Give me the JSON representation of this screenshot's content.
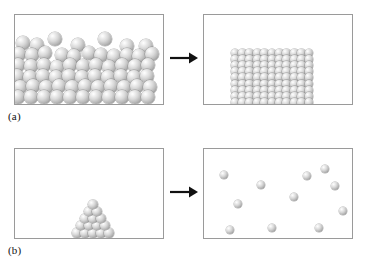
{
  "figure": {
    "panel_border_color": "#9a9a9a",
    "background_color": "#ffffff",
    "sphere_color": "#b4b4b4",
    "arrow_color": "#111111"
  },
  "rows": [
    {
      "id": "a",
      "caption": "(a)",
      "arrow": "right-arrow",
      "left_panel": {
        "name": "disordered-dense-particles",
        "particle_count": 72,
        "description": "many spheres packed irregularly filling lower two-thirds of box"
      },
      "right_panel": {
        "name": "ordered-crystal-lattice",
        "particle_count": 99,
        "lattice_columns": 11,
        "lattice_rows": 9,
        "description": "spheres arranged in regular square grid resting on box floor"
      }
    },
    {
      "id": "b",
      "caption": "(b)",
      "arrow": "right-arrow",
      "left_panel": {
        "name": "ordered-pyramid-stack",
        "particle_count": 15,
        "pyramid_rows": [
          5,
          4,
          3,
          2,
          1
        ],
        "description": "triangular stack of spheres on box floor right of center"
      },
      "right_panel": {
        "name": "dispersed-gas-particles",
        "particle_count": 11,
        "description": "isolated spheres scattered through box volume"
      }
    }
  ],
  "particles": {
    "a_left": [
      [
        8,
        28,
        7
      ],
      [
        22,
        30,
        7
      ],
      [
        40,
        24,
        7
      ],
      [
        63,
        30,
        7
      ],
      [
        90,
        24,
        7
      ],
      [
        112,
        31,
        7
      ],
      [
        131,
        31,
        7
      ],
      [
        4,
        39,
        7
      ],
      [
        17,
        40,
        7
      ],
      [
        30,
        38,
        7
      ],
      [
        47,
        40,
        7
      ],
      [
        59,
        41,
        7
      ],
      [
        74,
        38,
        7
      ],
      [
        86,
        40,
        7
      ],
      [
        99,
        41,
        7
      ],
      [
        112,
        40,
        7
      ],
      [
        124,
        41,
        7
      ],
      [
        137,
        39,
        7
      ],
      [
        3,
        50,
        7
      ],
      [
        16,
        51,
        7
      ],
      [
        29,
        50,
        7
      ],
      [
        42,
        52,
        7
      ],
      [
        55,
        50,
        7
      ],
      [
        68,
        51,
        7
      ],
      [
        81,
        50,
        7
      ],
      [
        94,
        52,
        7
      ],
      [
        107,
        50,
        7
      ],
      [
        120,
        51,
        7
      ],
      [
        133,
        50,
        7
      ],
      [
        2,
        61,
        7
      ],
      [
        15,
        62,
        7
      ],
      [
        28,
        61,
        7
      ],
      [
        41,
        62,
        7
      ],
      [
        54,
        61,
        7
      ],
      [
        67,
        62,
        7
      ],
      [
        80,
        61,
        7
      ],
      [
        93,
        62,
        7
      ],
      [
        106,
        61,
        7
      ],
      [
        119,
        62,
        7
      ],
      [
        132,
        61,
        7
      ],
      [
        5,
        72,
        7
      ],
      [
        18,
        71,
        7
      ],
      [
        31,
        72,
        7
      ],
      [
        44,
        71,
        7
      ],
      [
        57,
        72,
        7
      ],
      [
        70,
        71,
        7
      ],
      [
        83,
        72,
        7
      ],
      [
        96,
        71,
        7
      ],
      [
        109,
        72,
        7
      ],
      [
        122,
        71,
        7
      ],
      [
        135,
        72,
        7
      ],
      [
        3,
        82,
        7
      ],
      [
        16,
        82,
        7
      ],
      [
        29,
        82,
        7
      ],
      [
        42,
        82,
        7
      ],
      [
        55,
        82,
        7
      ],
      [
        68,
        82,
        7
      ],
      [
        81,
        82,
        7
      ],
      [
        94,
        82,
        7
      ],
      [
        107,
        82,
        7
      ],
      [
        120,
        82,
        7
      ],
      [
        133,
        82,
        7
      ]
    ],
    "a_right": {
      "start_x": 31,
      "start_y": 38,
      "step_x": 7.4,
      "step_y": 6.2,
      "cols": 11,
      "rows": 9,
      "radius": 4.4
    },
    "b_left": {
      "apex_x": 78,
      "base_y": 84,
      "step_x": 8.0,
      "step_y": 7.2,
      "rows": 5,
      "radius": 4.6
    },
    "b_right": [
      [
        20,
        26,
        4.4
      ],
      [
        57,
        36,
        4.4
      ],
      [
        90,
        48,
        4.4
      ],
      [
        121,
        20,
        4.4
      ],
      [
        131,
        37,
        4.4
      ],
      [
        34,
        55,
        4.4
      ],
      [
        139,
        62,
        4.4
      ],
      [
        26,
        81,
        4.4
      ],
      [
        68,
        79,
        4.4
      ],
      [
        115,
        79,
        4.4
      ],
      [
        103,
        27,
        4.4
      ]
    ]
  }
}
